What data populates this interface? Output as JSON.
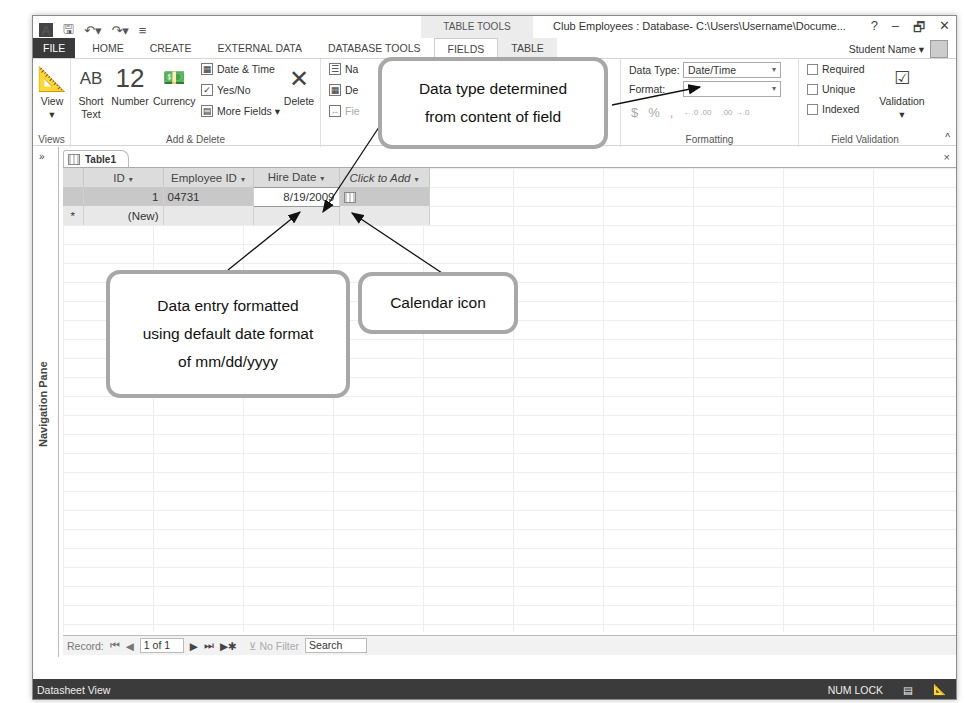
{
  "titlebar": {
    "qat_icons": [
      "access-logo-icon",
      "save-icon",
      "undo-icon",
      "redo-icon",
      "customize-qat-icon"
    ],
    "context_group": "TABLE TOOLS",
    "window_title": "Club Employees : Database- C:\\Users\\Username\\Docume...",
    "controls": {
      "help": "?",
      "minimize": "–",
      "restore": "🗗",
      "close": "✕"
    }
  },
  "tabs": {
    "file": "FILE",
    "home": "HOME",
    "create": "CREATE",
    "external_data": "EXTERNAL DATA",
    "database_tools": "DATABASE TOOLS",
    "fields": "FIELDS",
    "table": "TABLE"
  },
  "user": {
    "name": "Student Name ▾"
  },
  "ribbon": {
    "views": {
      "view_label": "View",
      "view_caret": "▾",
      "group_label": "Views"
    },
    "add_delete": {
      "short_text_icon": "AB",
      "short_text_label": "Short Text",
      "number_icon": "12",
      "number_label": "Number",
      "currency_label": "Currency",
      "date_time": "Date & Time",
      "yes_no": "Yes/No",
      "more_fields": "More Fields ▾",
      "delete_label": "Delete",
      "group_label": "Add & Delete"
    },
    "properties": {
      "name_caption": "Na",
      "default_value": "De",
      "field_size": "Fie",
      "memo_settings": "ngs ▾"
    },
    "formatting": {
      "data_type_label": "Data Type:",
      "data_type_value": "Date/Time",
      "format_label": "Format:",
      "format_value": "",
      "currency_symbol": "$",
      "percent_symbol": "%",
      "comma_symbol": ",",
      "increase_decimals": "←.0 .00",
      "decrease_decimals": ".00 →.0",
      "group_label": "Formatting"
    },
    "field_validation": {
      "required": "Required",
      "unique": "Unique",
      "indexed": "Indexed",
      "validation_label": "Validation",
      "validation_caret": "▾",
      "group_label": "Field Validation"
    },
    "collapse": "^"
  },
  "navpane": {
    "toggle": "»",
    "label": "Navigation Pane"
  },
  "document": {
    "tab_label": "Table1",
    "close": "×",
    "columns": [
      "ID",
      "Employee ID",
      "Hire Date",
      "Click to Add"
    ],
    "rows": [
      {
        "id": "1",
        "employee_id": "04731",
        "hire_date": "8/19/2009"
      }
    ],
    "new_row_marker": "*",
    "new_row_label": "(New)"
  },
  "record_nav": {
    "label": "Record:",
    "first": "⏮",
    "prev": "◀",
    "current": "1 of 1",
    "next": "▶",
    "last": "⏭",
    "new": "▶✱",
    "filter": "No Filter",
    "search": "Search"
  },
  "status": {
    "view": "Datasheet View",
    "num_lock": "NUM LOCK"
  },
  "callouts": {
    "data_type": "Data type determined from content of field",
    "date_format_line1": "Data entry formatted",
    "date_format_line2": "using default date format",
    "date_format_line3": "of mm/dd/yyyy",
    "calendar": "Calendar icon"
  },
  "colors": {
    "file_tab": "#3a3a3a",
    "status_bar": "#3b3b3b",
    "callout_border": "#a8a8a8",
    "header_gray": "#dcdcdc"
  }
}
